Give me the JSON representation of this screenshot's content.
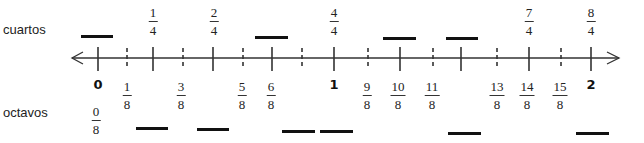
{
  "labels": {
    "top_row": "cuartos",
    "bottom_row": "octavos"
  },
  "number_line": {
    "start": 0,
    "end": 2,
    "subdivisions_per_unit": 8,
    "arrows": "both",
    "ticks": [
      {
        "value": "0",
        "x": 98,
        "style": "solid"
      },
      {
        "value": "1/8",
        "x": 127,
        "style": "dashed"
      },
      {
        "value": "2/8",
        "x": 153,
        "style": "solid"
      },
      {
        "value": "3/8",
        "x": 183,
        "style": "dashed"
      },
      {
        "value": "4/8",
        "x": 213,
        "style": "solid"
      },
      {
        "value": "5/8",
        "x": 243,
        "style": "dashed"
      },
      {
        "value": "6/8",
        "x": 272,
        "style": "solid"
      },
      {
        "value": "7/8",
        "x": 302,
        "style": "dashed"
      },
      {
        "value": "8/8",
        "x": 334,
        "style": "solid"
      },
      {
        "value": "9/8",
        "x": 368,
        "style": "dashed"
      },
      {
        "value": "10/8",
        "x": 400,
        "style": "solid"
      },
      {
        "value": "11/8",
        "x": 433,
        "style": "dashed"
      },
      {
        "value": "12/8",
        "x": 461,
        "style": "solid"
      },
      {
        "value": "13/8",
        "x": 497,
        "style": "dashed"
      },
      {
        "value": "14/8",
        "x": 529,
        "style": "solid"
      },
      {
        "value": "15/8",
        "x": 561,
        "style": "dashed"
      },
      {
        "value": "16/8",
        "x": 591,
        "style": "solid"
      }
    ]
  },
  "quarters": [
    {
      "num": "1",
      "den": "4",
      "x": 153
    },
    {
      "num": "2",
      "den": "4",
      "x": 214
    },
    {
      "num": "4",
      "den": "4",
      "x": 334
    },
    {
      "num": "7",
      "den": "4",
      "x": 529
    },
    {
      "num": "8",
      "den": "4",
      "x": 591
    }
  ],
  "quarter_blanks": [
    {
      "x1": 81,
      "x2": 113,
      "y": 36
    },
    {
      "x1": 255,
      "x2": 288,
      "y": 37
    },
    {
      "x1": 383,
      "x2": 416,
      "y": 38
    },
    {
      "x1": 446,
      "x2": 478,
      "y": 38
    }
  ],
  "wholes": [
    {
      "text": "0",
      "x": 98
    },
    {
      "text": "1",
      "x": 334
    },
    {
      "text": "2",
      "x": 591
    }
  ],
  "eighths": [
    {
      "num": "0",
      "den": "8",
      "x": 96,
      "row": "low"
    },
    {
      "num": "1",
      "den": "8",
      "x": 127,
      "row": "high"
    },
    {
      "num": "3",
      "den": "8",
      "x": 181,
      "row": "high"
    },
    {
      "num": "5",
      "den": "8",
      "x": 242,
      "row": "high"
    },
    {
      "num": "6",
      "den": "8",
      "x": 271,
      "row": "high"
    },
    {
      "num": "9",
      "den": "8",
      "x": 367,
      "row": "high"
    },
    {
      "num": "10",
      "den": "8",
      "x": 398,
      "row": "high"
    },
    {
      "num": "11",
      "den": "8",
      "x": 432,
      "row": "high"
    },
    {
      "num": "13",
      "den": "8",
      "x": 497,
      "row": "high"
    },
    {
      "num": "14",
      "den": "8",
      "x": 527,
      "row": "high"
    },
    {
      "num": "15",
      "den": "8",
      "x": 560,
      "row": "high"
    }
  ],
  "eighth_blanks": [
    {
      "x1": 136,
      "x2": 168,
      "y": 128
    },
    {
      "x1": 197,
      "x2": 229,
      "y": 129
    },
    {
      "x1": 282,
      "x2": 315,
      "y": 131
    },
    {
      "x1": 320,
      "x2": 353,
      "y": 131
    },
    {
      "x1": 448,
      "x2": 481,
      "y": 133
    },
    {
      "x1": 576,
      "x2": 609,
      "y": 133
    }
  ],
  "colors": {
    "line": "#333333",
    "blank": "#111111",
    "text": "#222222"
  }
}
